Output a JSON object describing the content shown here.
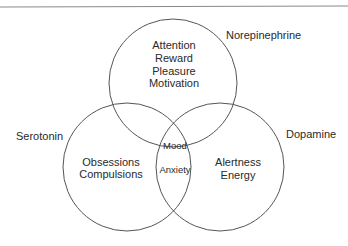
{
  "diagram": {
    "type": "venn",
    "colors": {
      "stroke": "#555555",
      "text": "#2a2a2a",
      "top_rule": "#888888"
    },
    "sets": [
      {
        "id": "norepinephrine",
        "label": "Norepinephrine",
        "cx": 173,
        "cy": 83,
        "r": 64
      },
      {
        "id": "serotonin",
        "label": "Serotonin",
        "cx": 127,
        "cy": 167,
        "r": 64
      },
      {
        "id": "dopamine",
        "label": "Dopamine",
        "cx": 220,
        "cy": 167,
        "r": 64
      }
    ],
    "regions": {
      "norepinephrine_only": [
        "Attention",
        "Reward",
        "Pleasure",
        "Motivation"
      ],
      "serotonin_only": [
        "Obsessions",
        "Compulsions"
      ],
      "dopamine_only": [
        "Alertness",
        "Energy"
      ],
      "all_three": "Mood",
      "serotonin_dopamine": "Anxiety"
    }
  }
}
